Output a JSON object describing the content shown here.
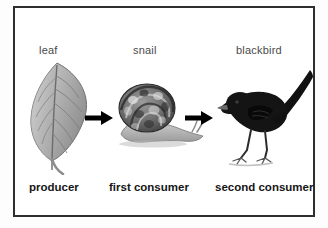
{
  "diagram": {
    "border_color": "#2e2e2e",
    "background_color": "#ffffff",
    "label_color": "#4a4a4a",
    "role_label_color": "#161616",
    "arrow_color": "#000000",
    "steps": [
      {
        "name_label": "leaf",
        "role_label": "producer",
        "icon": "leaf-illustration"
      },
      {
        "name_label": "snail",
        "role_label": "first consumer",
        "icon": "snail-illustration"
      },
      {
        "name_label": "blackbird",
        "role_label": "second consumer",
        "icon": "blackbird-illustration"
      }
    ],
    "arrows": [
      {
        "icon": "arrow-right-icon",
        "from": "leaf",
        "to": "snail"
      },
      {
        "icon": "arrow-right-icon",
        "from": "snail",
        "to": "blackbird"
      }
    ]
  }
}
